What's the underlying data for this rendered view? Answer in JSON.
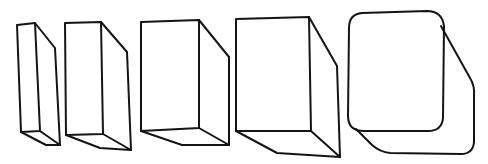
{
  "figure": {
    "background_color": "#ffffff",
    "line_color": "#141414",
    "shapes": [
      {
        "id": "box-1",
        "kind": "box",
        "label": "narrow box"
      },
      {
        "id": "box-2",
        "kind": "box",
        "label": "slim box"
      },
      {
        "id": "box-3",
        "kind": "box",
        "label": "medium box"
      },
      {
        "id": "box-4",
        "kind": "box",
        "label": "wide box"
      },
      {
        "id": "box-5",
        "kind": "rounded-box",
        "label": "rounded box"
      }
    ]
  }
}
